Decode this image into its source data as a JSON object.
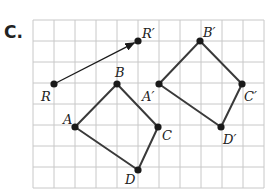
{
  "figure": {
    "part_label": "C.",
    "grid": {
      "x0": 33,
      "y0": 20,
      "cell": 21,
      "cols": 11,
      "rows": 8,
      "line_color": "#c8c8c8"
    },
    "colors": {
      "shape": "#3a3a3a",
      "point": "#1a1a1a",
      "text": "#222222"
    },
    "points": [
      {
        "name": "R",
        "label": "R",
        "x": 54,
        "y": 84,
        "lx": 41,
        "ly": 101
      },
      {
        "name": "R'",
        "label": "R′",
        "x": 138,
        "y": 41,
        "lx": 142,
        "ly": 38
      },
      {
        "name": "A",
        "label": "A",
        "x": 75,
        "y": 127,
        "lx": 63,
        "ly": 124
      },
      {
        "name": "B",
        "label": "B",
        "x": 117,
        "y": 84,
        "lx": 115,
        "ly": 77
      },
      {
        "name": "C",
        "label": "C",
        "x": 158,
        "y": 127,
        "lx": 162,
        "ly": 140
      },
      {
        "name": "D",
        "label": "D",
        "x": 138,
        "y": 170,
        "lx": 125,
        "ly": 184
      },
      {
        "name": "A'",
        "label": "A′",
        "x": 159,
        "y": 84,
        "lx": 142,
        "ly": 101
      },
      {
        "name": "B'",
        "label": "B′",
        "x": 200,
        "y": 41,
        "lx": 203,
        "ly": 37
      },
      {
        "name": "C'",
        "label": "C′",
        "x": 242,
        "y": 84,
        "lx": 244,
        "ly": 101
      },
      {
        "name": "D'",
        "label": "D′",
        "x": 221,
        "y": 127,
        "lx": 223,
        "ly": 144
      }
    ],
    "translation_vector": {
      "from": "R",
      "to": "R'"
    },
    "polygons": [
      {
        "name": "ABCD",
        "vertices": [
          "A",
          "B",
          "C",
          "D"
        ]
      },
      {
        "name": "A'B'C'D'",
        "vertices": [
          "A'",
          "B'",
          "C'",
          "D'"
        ]
      }
    ]
  }
}
